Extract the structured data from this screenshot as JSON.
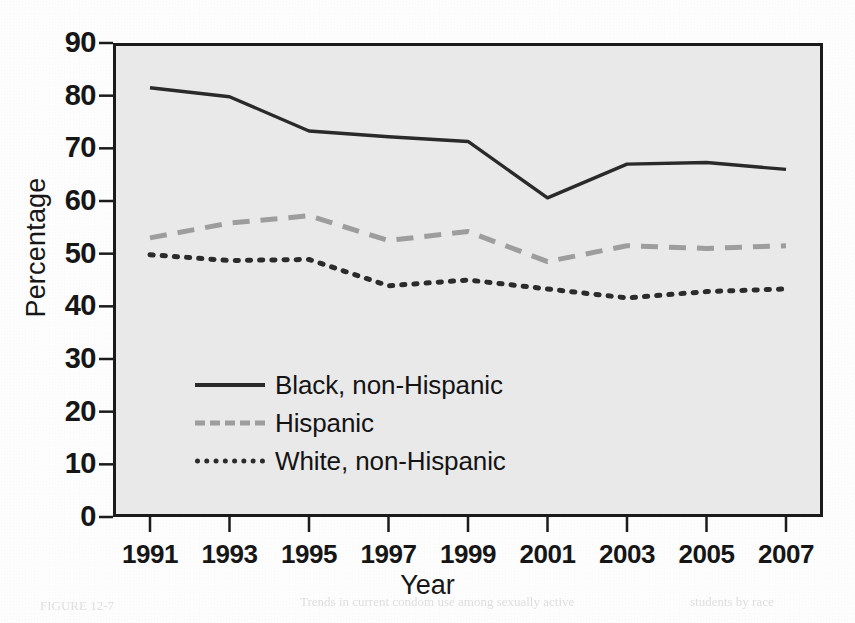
{
  "chart_data": {
    "type": "line",
    "title": "",
    "xlabel": "Year",
    "ylabel": "Percentage",
    "x": [
      1991,
      1993,
      1995,
      1997,
      1999,
      2001,
      2003,
      2005,
      2007
    ],
    "xtick_labels": [
      "1991",
      "1993",
      "1995",
      "1997",
      "1999",
      "2001",
      "2003",
      "2005",
      "2007"
    ],
    "ytick_labels": [
      "90",
      "80",
      "70",
      "60",
      "50",
      "40",
      "30",
      "20",
      "10",
      "0"
    ],
    "ylim": [
      0,
      90
    ],
    "ytick_step": 10,
    "xlim": [
      1991,
      2007
    ],
    "grid": false,
    "legend_position": "center-left inside axes",
    "plot_background": "#e9e9e9",
    "series": [
      {
        "name": "Black, non-Hispanic",
        "style": "solid",
        "color": "#2a2a2a",
        "values": [
          81.5,
          79.8,
          73.3,
          72.2,
          71.3,
          60.6,
          67.0,
          67.3,
          66.0
        ]
      },
      {
        "name": "Hispanic",
        "style": "dashed",
        "color": "#9d9d9d",
        "values": [
          53.0,
          55.8,
          57.2,
          52.5,
          54.2,
          48.5,
          51.5,
          51.0,
          51.5
        ]
      },
      {
        "name": "White, non-Hispanic",
        "style": "dotted",
        "color": "#2b2b2b",
        "values": [
          49.8,
          48.7,
          48.9,
          43.9,
          45.0,
          43.3,
          41.6,
          42.8,
          43.3
        ]
      }
    ]
  },
  "legend": {
    "items": [
      {
        "label": "Black, non-Hispanic"
      },
      {
        "label": "Hispanic"
      },
      {
        "label": "White, non-Hispanic"
      }
    ]
  },
  "axes": {
    "y_title": "Percentage",
    "x_title": "Year"
  }
}
